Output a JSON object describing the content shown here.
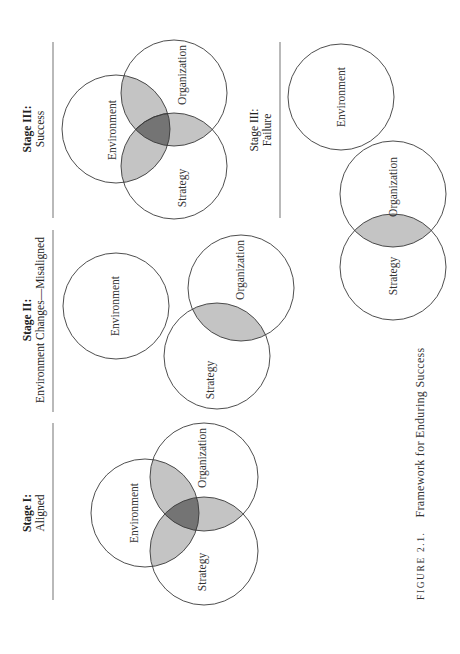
{
  "figure": {
    "caption_number": "FIGURE 2.1.",
    "caption_title": "Framework for Enduring Success",
    "orientation": "rotated 90° counter-clockwise (text reads bottom-to-top)"
  },
  "colors": {
    "stroke": "#3a3a3a",
    "two_way_overlap": "#c4c4c4",
    "three_way_overlap": "#747474",
    "divider": "#8a8a8a"
  },
  "panels": [
    {
      "id": "stage-1",
      "heading_bold": "Stage I:",
      "heading_sub": "Aligned",
      "circles": [
        "Environment",
        "Organization",
        "Strategy"
      ],
      "overlaps": [
        "Environment∩Organization",
        "Environment∩Strategy",
        "Organization∩Strategy",
        "Environment∩Organization∩Strategy"
      ]
    },
    {
      "id": "stage-2",
      "heading_bold": "Stage II:",
      "heading_sub": "Environment Changes—Misaligned",
      "circles": [
        "Environment",
        "Organization",
        "Strategy"
      ],
      "overlaps": [
        "Organization∩Strategy"
      ]
    },
    {
      "id": "stage-3-success",
      "heading_bold": "Stage III:",
      "heading_sub": "Success",
      "circles": [
        "Environment",
        "Organization",
        "Strategy"
      ],
      "overlaps": [
        "Environment∩Organization",
        "Environment∩Strategy",
        "Organization∩Strategy",
        "Environment∩Organization∩Strategy"
      ]
    },
    {
      "id": "stage-3-failure",
      "heading_bold": "Stage III:",
      "heading_sub": "Failure",
      "circles": [
        "Environment",
        "Organization",
        "Strategy"
      ],
      "overlaps": [
        "Organization∩Strategy"
      ]
    }
  ]
}
